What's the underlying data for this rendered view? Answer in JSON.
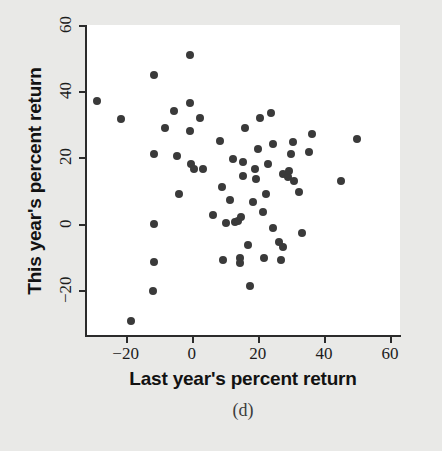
{
  "figure": {
    "caption": "(d)",
    "background_color": "#e9e9e7",
    "panel_color": "#ffffff",
    "point_color": "#3a3a3a",
    "axis_color": "#2b2b2b"
  },
  "chart_data": {
    "type": "scatter",
    "title": "",
    "xlabel": "Last year's percent return",
    "ylabel": "This year's percent return",
    "xlim": [
      -32,
      63
    ],
    "ylim": [
      -34,
      60
    ],
    "xticks": [
      -20,
      0,
      20,
      40,
      60
    ],
    "yticks": [
      -20,
      0,
      20,
      40,
      60
    ],
    "xtick_labels": [
      "−20",
      "0",
      "20",
      "40",
      "60"
    ],
    "ytick_labels": [
      "−20",
      "0",
      "20",
      "40",
      "60"
    ],
    "grid": false,
    "legend": null,
    "n_points": 63,
    "points": [
      {
        "x": -28.8,
        "y": 37.0
      },
      {
        "x": -21.5,
        "y": 31.5
      },
      {
        "x": -11.5,
        "y": 45.0
      },
      {
        "x": -11.5,
        "y": 21.0
      },
      {
        "x": -11.5,
        "y": 0.0
      },
      {
        "x": -11.5,
        "y": -11.5
      },
      {
        "x": -11.8,
        "y": -20.5
      },
      {
        "x": -18.5,
        "y": -29.5
      },
      {
        "x": -8.0,
        "y": 29.0
      },
      {
        "x": -5.5,
        "y": 34.0
      },
      {
        "x": -4.5,
        "y": 20.5
      },
      {
        "x": -4.0,
        "y": 9.0
      },
      {
        "x": -0.6,
        "y": 51.0
      },
      {
        "x": -0.6,
        "y": 36.5
      },
      {
        "x": -0.6,
        "y": 28.0
      },
      {
        "x": -0.3,
        "y": 18.0
      },
      {
        "x": 0.6,
        "y": 16.5
      },
      {
        "x": 2.5,
        "y": 32.0
      },
      {
        "x": 3.5,
        "y": 16.5
      },
      {
        "x": 8.5,
        "y": 25.0
      },
      {
        "x": 9.0,
        "y": 11.0
      },
      {
        "x": 9.5,
        "y": -11.0
      },
      {
        "x": 11.5,
        "y": 7.0
      },
      {
        "x": 10.5,
        "y": 0.2
      },
      {
        "x": 13.0,
        "y": 0.5
      },
      {
        "x": 14.0,
        "y": 0.8
      },
      {
        "x": 14.5,
        "y": -10.5
      },
      {
        "x": 14.5,
        "y": -11.8
      },
      {
        "x": 15.0,
        "y": 2.0
      },
      {
        "x": 15.5,
        "y": 18.5
      },
      {
        "x": 15.5,
        "y": 14.5
      },
      {
        "x": 16.0,
        "y": 29.0
      },
      {
        "x": 17.5,
        "y": -19.0
      },
      {
        "x": 19.0,
        "y": 16.5
      },
      {
        "x": 19.5,
        "y": 13.5
      },
      {
        "x": 20.0,
        "y": 22.5
      },
      {
        "x": 20.5,
        "y": 32.0
      },
      {
        "x": 21.5,
        "y": 3.5
      },
      {
        "x": 22.0,
        "y": -10.5
      },
      {
        "x": 22.5,
        "y": 9.0
      },
      {
        "x": 24.0,
        "y": 33.5
      },
      {
        "x": 24.5,
        "y": 24.0
      },
      {
        "x": 24.5,
        "y": -1.5
      },
      {
        "x": 26.5,
        "y": -5.5
      },
      {
        "x": 27.0,
        "y": -11.0
      },
      {
        "x": 27.5,
        "y": -7.0
      },
      {
        "x": 27.5,
        "y": 15.0
      },
      {
        "x": 29.0,
        "y": 14.0
      },
      {
        "x": 29.5,
        "y": 16.0
      },
      {
        "x": 30.0,
        "y": 21.0
      },
      {
        "x": 30.5,
        "y": 24.5
      },
      {
        "x": 31.0,
        "y": 13.0
      },
      {
        "x": 32.5,
        "y": 9.5
      },
      {
        "x": 33.5,
        "y": -3.0
      },
      {
        "x": 35.5,
        "y": 21.5
      },
      {
        "x": 36.5,
        "y": 27.0
      },
      {
        "x": 45.0,
        "y": 13.0
      },
      {
        "x": 50.0,
        "y": 25.5
      },
      {
        "x": 6.5,
        "y": 2.5
      },
      {
        "x": 12.5,
        "y": 19.5
      },
      {
        "x": 17.0,
        "y": -6.5
      },
      {
        "x": 18.5,
        "y": 6.5
      },
      {
        "x": 23.0,
        "y": 18.0
      }
    ]
  }
}
